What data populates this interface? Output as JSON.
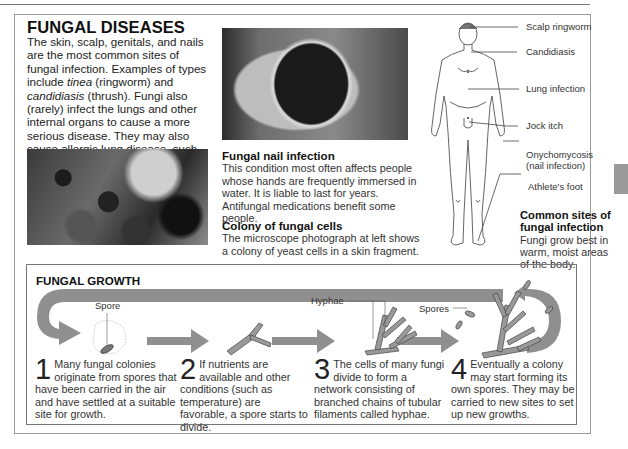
{
  "page": {
    "title": "FUNGAL DISEASES",
    "intro_parts": {
      "p1": "The skin, scalp, genitals, and nails are the most common sites of fungal infection. Examples of types include ",
      "tinea": "tinea",
      "p2": " (ringworm) and ",
      "candidiasis": "candidiasis",
      "p3": " (thrush). Fungi also (rarely) infect the lungs and other internal organs to cause a more serious disease. They may also cause allergic lung disease, such as farmers' lung."
    }
  },
  "images": {
    "microscope_photo": "Microscope photograph of yeast cell colony",
    "nail_photo": "Photograph of fungal nail infection"
  },
  "captions": {
    "nail": {
      "title": "Fungal nail infection",
      "body": "This condition most often affects people whose hands are frequently immersed in water. It is liable to last for years. Antifungal medications benefit some people."
    },
    "colony": {
      "title": "Colony of fungal cells",
      "body": "The microscope photograph at left shows a colony of yeast cells in a skin fragment."
    },
    "sites": {
      "title": "Common sites of fungal infection",
      "body": "Fungi grow best in warm, moist areas of the body."
    }
  },
  "body_labels": [
    {
      "label": "Scalp ringworm"
    },
    {
      "label": "Candidiasis"
    },
    {
      "label": "Lung infection"
    },
    {
      "label": "Jock itch"
    },
    {
      "label": "Onychomycosis",
      "sub": "(nail infection)"
    },
    {
      "label": "Athlete's foot"
    }
  ],
  "growth": {
    "title": "FUNGAL GROWTH",
    "annotations": {
      "spore": "Spore",
      "hyphae": "Hyphae",
      "spores": "Spores"
    },
    "steps": [
      {
        "num": "1",
        "text": "Many fungal colonies originate from spores that have been carried in the air and have settled at a suitable site for growth."
      },
      {
        "num": "2",
        "text": "If nutrients are available and other conditions (such as temperature) are favorable, a spore starts to divide."
      },
      {
        "num": "3",
        "text": "The cells of many fungi divide to form a network consisting of branched chains of tubular filaments called hyphae."
      },
      {
        "num": "4",
        "text": "Eventually a colony may start forming its own spores. They may be carried to new sites to set up new growths."
      }
    ]
  },
  "colors": {
    "arrow": "#8f8f8f",
    "fungus": "#9a9a9a",
    "text": "#222222",
    "border": "#777777"
  }
}
